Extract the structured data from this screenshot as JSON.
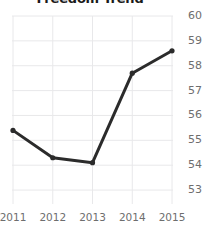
{
  "chart_data": {
    "type": "line",
    "title": "Freedom Trend",
    "xlabel": "",
    "ylabel": "",
    "categories": [
      "2011",
      "2012",
      "2013",
      "2014",
      "2015"
    ],
    "x": [
      2011,
      2012,
      2013,
      2014,
      2015
    ],
    "values": [
      55.4,
      54.3,
      54.1,
      57.7,
      58.6
    ],
    "series": [
      {
        "name": "Freedom Trend",
        "values": [
          55.4,
          54.3,
          54.1,
          57.7,
          58.6
        ]
      }
    ],
    "ylim": [
      52.6,
      60.0
    ],
    "yticks": [
      60,
      59,
      58,
      57,
      56,
      55,
      54,
      53
    ],
    "ytick_labels": [
      "60",
      "59",
      "58",
      "57",
      "56",
      "55",
      "54",
      "53"
    ],
    "xtick_labels": [
      "2011",
      "2012",
      "2013",
      "2014",
      "2015"
    ],
    "grid": true,
    "grid_color": "#e8e8ea",
    "legend": false,
    "legend_position": "none",
    "line_color": "#2b2b2b",
    "marker": "circle",
    "marker_color": "#2b2b2b",
    "background_color": "#ffffff",
    "tick_label_color": "#6e6e6e",
    "title_color": "#1a1a1a"
  }
}
